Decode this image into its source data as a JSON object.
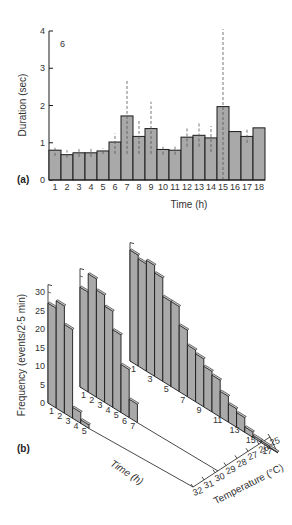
{
  "chart_data": [
    {
      "type": "bar",
      "panel_label": "(a)",
      "annotation": "6",
      "title": "",
      "xlabel": "Time (h)",
      "ylabel": "Duration (sec)",
      "ylim": [
        0,
        4
      ],
      "yticks": [
        0,
        1,
        2,
        3,
        4
      ],
      "categories": [
        "1",
        "2",
        "3",
        "4",
        "5",
        "6",
        "7",
        "8",
        "9",
        "10",
        "11",
        "12",
        "13",
        "14",
        "15",
        "16",
        "17",
        "18"
      ],
      "values": [
        0.8,
        0.68,
        0.73,
        0.73,
        0.78,
        1.02,
        1.72,
        1.17,
        1.38,
        0.82,
        0.8,
        1.15,
        1.2,
        1.13,
        1.97,
        1.3,
        1.17,
        1.4
      ],
      "error_low": [
        0.65,
        0.6,
        0.62,
        0.62,
        0.7,
        0.7,
        0.7,
        0.7,
        0.7,
        0.68,
        0.68,
        0.9,
        0.9,
        0.75,
        0.0,
        1.3,
        1.0,
        1.4
      ],
      "error_high": [
        0.92,
        0.8,
        0.83,
        0.85,
        0.85,
        1.25,
        2.7,
        1.6,
        2.1,
        0.95,
        0.92,
        1.42,
        1.52,
        1.45,
        4.05,
        1.3,
        1.35,
        1.4
      ],
      "error_style": "dashed",
      "grid": false
    },
    {
      "type": "bar3d",
      "panel_label": "(b)",
      "xlabel": "Time (h)",
      "ylabel": "Frequency (events/2·5 min)",
      "zlabel": "Temperature (°C)",
      "ylim": [
        0,
        30
      ],
      "yticks": [
        0,
        5,
        10,
        15,
        20,
        25,
        30
      ],
      "temperature_ticks": [
        "32",
        "31",
        "30",
        "29",
        "28",
        "27",
        "26",
        "25"
      ],
      "series": [
        {
          "name": "block-front",
          "time_labels": [
            "1",
            "2",
            "3",
            "4",
            "5"
          ],
          "values": [
            27,
            29,
            24,
            3,
            1
          ]
        },
        {
          "name": "block-middle",
          "time_labels": [
            "1",
            "2",
            "3",
            "4",
            "5",
            "6",
            "7"
          ],
          "values": [
            27,
            32,
            29,
            26,
            21,
            13,
            5
          ]
        },
        {
          "name": "block-back",
          "time_labels": [
            "1",
            "3",
            "5",
            "7",
            "9",
            "11",
            "13",
            "15",
            "17"
          ],
          "values": [
            30,
            29,
            30,
            28,
            23,
            23,
            18,
            14,
            13,
            11,
            10,
            7,
            5,
            4,
            1.5,
            0.6,
            0.5,
            0.2
          ]
        }
      ]
    }
  ]
}
